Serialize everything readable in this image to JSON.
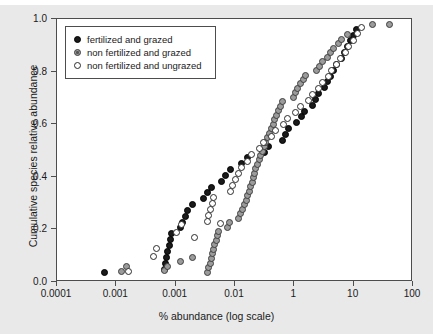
{
  "chart_data": {
    "type": "scatter",
    "title": "",
    "xlabel": "% abundance (log scale)",
    "ylabel": "Cumulative species relative abundance",
    "xscale": "log",
    "xlim": [
      0.0001,
      100
    ],
    "ylim": [
      0.0,
      1.0
    ],
    "grid": false,
    "legend_position": "top-left inside",
    "xticks": [
      {
        "value": 0.0001,
        "label": "0.0001"
      },
      {
        "value": 0.001,
        "label": "0.001"
      },
      {
        "value": 0.01,
        "label": "0.001"
      },
      {
        "value": 0.1,
        "label": "0.01"
      },
      {
        "value": 1,
        "label": "1"
      },
      {
        "value": 10,
        "label": "10"
      },
      {
        "value": 100,
        "label": "100"
      }
    ],
    "yticks": [
      {
        "value": 0.0,
        "label": "0.0"
      },
      {
        "value": 0.2,
        "label": "0.2"
      },
      {
        "value": 0.4,
        "label": "0.4"
      },
      {
        "value": 0.6,
        "label": "0.6"
      },
      {
        "value": 0.8,
        "label": "0.8"
      },
      {
        "value": 1.0,
        "label": "1.0"
      }
    ],
    "series": [
      {
        "name": "fertilized and grazed",
        "key": "fg",
        "marker": "filled-circle",
        "color": "#1a1a1a",
        "points": [
          [
            0.00062,
            0.038
          ],
          [
            0.0065,
            0.048
          ],
          [
            0.0068,
            0.072
          ],
          [
            0.0071,
            0.094
          ],
          [
            0.0074,
            0.117
          ],
          [
            0.0078,
            0.139
          ],
          [
            0.0082,
            0.161
          ],
          [
            0.0086,
            0.183
          ],
          [
            0.012,
            0.206
          ],
          [
            0.013,
            0.228
          ],
          [
            0.0145,
            0.25
          ],
          [
            0.016,
            0.272
          ],
          [
            0.019,
            0.294
          ],
          [
            0.03,
            0.317
          ],
          [
            0.034,
            0.339
          ],
          [
            0.04,
            0.361
          ],
          [
            0.06,
            0.383
          ],
          [
            0.07,
            0.406
          ],
          [
            0.085,
            0.428
          ],
          [
            0.13,
            0.45
          ],
          [
            0.16,
            0.472
          ],
          [
            0.32,
            0.494
          ],
          [
            0.36,
            0.517
          ],
          [
            0.62,
            0.539
          ],
          [
            0.7,
            0.561
          ],
          [
            0.8,
            0.583
          ],
          [
            1.1,
            0.606
          ],
          [
            1.3,
            0.628
          ],
          [
            1.5,
            0.65
          ],
          [
            2.0,
            0.672
          ],
          [
            2.3,
            0.694
          ],
          [
            2.6,
            0.717
          ],
          [
            3.2,
            0.739
          ],
          [
            3.6,
            0.761
          ],
          [
            4.0,
            0.783
          ],
          [
            4.6,
            0.806
          ],
          [
            5.2,
            0.828
          ],
          [
            6.2,
            0.85
          ],
          [
            7.0,
            0.872
          ],
          [
            7.8,
            0.894
          ],
          [
            9.0,
            0.917
          ],
          [
            10.0,
            0.939
          ],
          [
            11.0,
            0.961
          ]
        ]
      },
      {
        "name": "non fertilized and grazed",
        "key": "nfg",
        "marker": "shaded-circle",
        "color": "#9b9b9b",
        "points": [
          [
            0.0012,
            0.04
          ],
          [
            0.0015,
            0.06
          ],
          [
            0.0065,
            0.042
          ],
          [
            0.0072,
            0.06
          ],
          [
            0.012,
            0.078
          ],
          [
            0.019,
            0.095
          ],
          [
            0.034,
            0.038
          ],
          [
            0.036,
            0.055
          ],
          [
            0.038,
            0.072
          ],
          [
            0.04,
            0.09
          ],
          [
            0.042,
            0.107
          ],
          [
            0.044,
            0.124
          ],
          [
            0.046,
            0.141
          ],
          [
            0.048,
            0.158
          ],
          [
            0.05,
            0.175
          ],
          [
            0.053,
            0.192
          ],
          [
            0.075,
            0.209
          ],
          [
            0.08,
            0.226
          ],
          [
            0.115,
            0.243
          ],
          [
            0.125,
            0.26
          ],
          [
            0.135,
            0.277
          ],
          [
            0.145,
            0.294
          ],
          [
            0.155,
            0.311
          ],
          [
            0.165,
            0.328
          ],
          [
            0.175,
            0.345
          ],
          [
            0.185,
            0.362
          ],
          [
            0.195,
            0.379
          ],
          [
            0.205,
            0.396
          ],
          [
            0.215,
            0.413
          ],
          [
            0.225,
            0.43
          ],
          [
            0.24,
            0.447
          ],
          [
            0.255,
            0.464
          ],
          [
            0.27,
            0.481
          ],
          [
            0.29,
            0.498
          ],
          [
            0.31,
            0.515
          ],
          [
            0.33,
            0.532
          ],
          [
            0.355,
            0.549
          ],
          [
            0.38,
            0.566
          ],
          [
            0.41,
            0.583
          ],
          [
            0.44,
            0.6
          ],
          [
            0.47,
            0.617
          ],
          [
            0.5,
            0.634
          ],
          [
            0.54,
            0.651
          ],
          [
            0.58,
            0.668
          ],
          [
            0.62,
            0.685
          ],
          [
            0.95,
            0.702
          ],
          [
            1.05,
            0.719
          ],
          [
            1.15,
            0.736
          ],
          [
            1.25,
            0.753
          ],
          [
            1.4,
            0.77
          ],
          [
            1.55,
            0.787
          ],
          [
            2.4,
            0.804
          ],
          [
            2.7,
            0.821
          ],
          [
            3.0,
            0.838
          ],
          [
            3.6,
            0.855
          ],
          [
            4.0,
            0.872
          ],
          [
            4.5,
            0.889
          ],
          [
            5.6,
            0.906
          ],
          [
            6.3,
            0.923
          ],
          [
            8.0,
            0.94
          ],
          [
            21.0,
            0.98
          ],
          [
            40.0,
            0.98
          ]
        ]
      },
      {
        "name": "non fertilized and ungrazed",
        "key": "nfu",
        "marker": "open-circle",
        "color": "#ffffff",
        "points": [
          [
            0.0016,
            0.04
          ],
          [
            0.0043,
            0.098
          ],
          [
            0.0047,
            0.128
          ],
          [
            0.0105,
            0.19
          ],
          [
            0.0125,
            0.22
          ],
          [
            0.021,
            0.17
          ],
          [
            0.034,
            0.23
          ],
          [
            0.036,
            0.253
          ],
          [
            0.038,
            0.276
          ],
          [
            0.041,
            0.299
          ],
          [
            0.044,
            0.322
          ],
          [
            0.058,
            0.222
          ],
          [
            0.085,
            0.345
          ],
          [
            0.092,
            0.368
          ],
          [
            0.1,
            0.391
          ],
          [
            0.115,
            0.414
          ],
          [
            0.13,
            0.437
          ],
          [
            0.165,
            0.46
          ],
          [
            0.19,
            0.483
          ],
          [
            0.26,
            0.506
          ],
          [
            0.3,
            0.529
          ],
          [
            0.42,
            0.552
          ],
          [
            0.48,
            0.575
          ],
          [
            0.66,
            0.598
          ],
          [
            0.78,
            0.621
          ],
          [
            1.05,
            0.644
          ],
          [
            1.25,
            0.667
          ],
          [
            1.7,
            0.69
          ],
          [
            2.0,
            0.713
          ],
          [
            2.6,
            0.736
          ],
          [
            3.0,
            0.759
          ],
          [
            3.7,
            0.782
          ],
          [
            4.3,
            0.805
          ],
          [
            5.2,
            0.828
          ],
          [
            6.0,
            0.851
          ],
          [
            7.2,
            0.874
          ],
          [
            8.3,
            0.897
          ],
          [
            10.0,
            0.92
          ],
          [
            11.5,
            0.943
          ],
          [
            13.5,
            0.966
          ]
        ]
      }
    ]
  },
  "legend": {
    "items": [
      {
        "label": "fertilized and grazed",
        "key": "fg"
      },
      {
        "label": "non fertilized and grazed",
        "key": "nfg"
      },
      {
        "label": "non fertilized and ungrazed",
        "key": "nfu"
      }
    ]
  },
  "axis": {
    "x_title": "% abundance (log scale)",
    "y_title": "Cumulative species relative abundance"
  }
}
